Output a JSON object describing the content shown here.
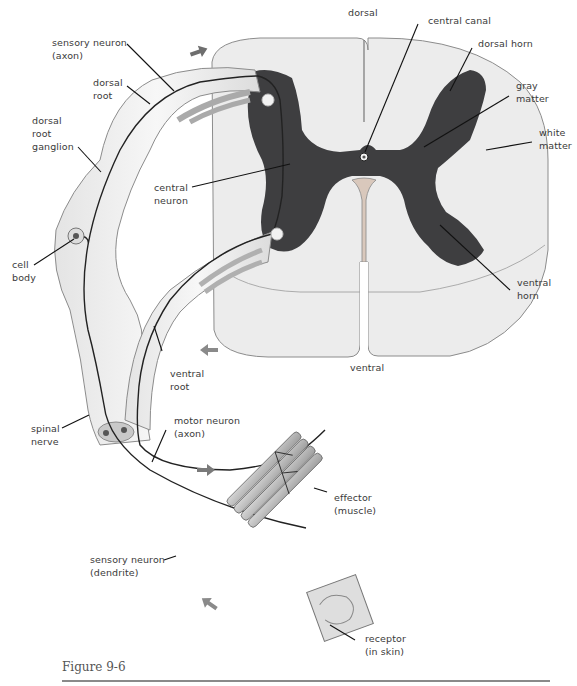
{
  "figure": {
    "caption": "Figure 9-6",
    "colors": {
      "gray_matter": "#3e3e40",
      "white_matter": "#ececec",
      "nerve_fill": "#efefef",
      "outline": "#8c8c8c",
      "leader_line": "#111111",
      "arrow": "#7a7a7a",
      "caption_rule": "#8a8a8a"
    },
    "labels": {
      "dorsal": "dorsal",
      "central_canal": "central canal",
      "dorsal_horn": "dorsal horn",
      "gray_matter": "gray\nmatter",
      "white_matter": "white\nmatter",
      "sensory_neuron_axon": "sensory neuron\n(axon)",
      "dorsal_root": "dorsal\nroot",
      "dorsal_root_ganglion": "dorsal\nroot\nganglion",
      "central_neuron": "central\nneuron",
      "cell_body": "cell\nbody",
      "ventral_horn": "ventral\nhorn",
      "ventral": "ventral",
      "ventral_root": "ventral\nroot",
      "spinal_nerve": "spinal\nnerve",
      "motor_neuron_axon": "motor neuron\n(axon)",
      "effector_muscle": "effector\n(muscle)",
      "sensory_neuron_dendrite": "sensory neuron\n(dendrite)",
      "receptor_in_skin": "receptor\n(in skin)"
    },
    "arrows": [
      {
        "name": "impulse-arrow-sensory-axon",
        "direction": "right"
      },
      {
        "name": "impulse-arrow-ventral-root",
        "direction": "left"
      },
      {
        "name": "impulse-arrow-motor-axon",
        "direction": "right"
      },
      {
        "name": "impulse-arrow-dendrite",
        "direction": "up-left"
      }
    ]
  }
}
